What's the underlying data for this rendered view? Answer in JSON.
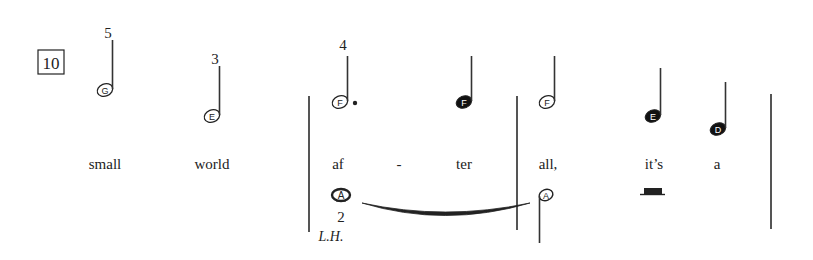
{
  "measure_number": "10",
  "colors": {
    "ink": "#222222",
    "barline": "#555555",
    "background": "#ffffff"
  },
  "upper_notes": [
    {
      "letter": "G",
      "filled": false,
      "finger": "5",
      "dotted": false
    },
    {
      "letter": "E",
      "filled": false,
      "finger": "3",
      "dotted": false
    },
    {
      "letter": "F",
      "filled": false,
      "finger": "4",
      "dotted": true
    },
    {
      "letter": "F",
      "filled": true,
      "finger": "",
      "dotted": false
    },
    {
      "letter": "F",
      "filled": false,
      "finger": "",
      "dotted": false
    },
    {
      "letter": "E",
      "filled": true,
      "finger": "",
      "dotted": false
    },
    {
      "letter": "D",
      "filled": true,
      "finger": "",
      "dotted": false
    }
  ],
  "lyrics": [
    "small",
    "world",
    "af",
    "-",
    "ter",
    "all,",
    "it’s",
    "a"
  ],
  "lower_notes": [
    {
      "letter": "A",
      "type": "whole",
      "finger": "2",
      "hand": "L.H."
    },
    {
      "letter": "A",
      "type": "half-stem-down"
    }
  ],
  "rest": "half-rest"
}
